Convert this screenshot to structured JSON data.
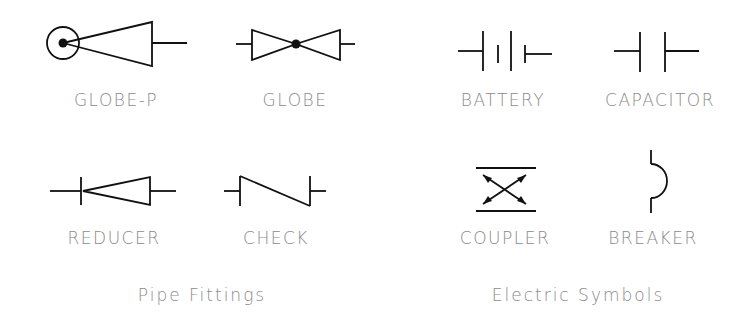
{
  "groups": {
    "pipe_fittings": {
      "title": "Pipe Fittings",
      "symbols": [
        {
          "name": "globe-p",
          "label": "GLOBE-P"
        },
        {
          "name": "globe",
          "label": "GLOBE"
        },
        {
          "name": "reducer",
          "label": "REDUCER"
        },
        {
          "name": "check",
          "label": "CHECK"
        }
      ]
    },
    "electric_symbols": {
      "title": "Electric Symbols",
      "symbols": [
        {
          "name": "battery",
          "label": "BATTERY"
        },
        {
          "name": "capacitor",
          "label": "CAPACITOR"
        },
        {
          "name": "coupler",
          "label": "COUPLER"
        },
        {
          "name": "breaker",
          "label": "BREAKER"
        }
      ]
    }
  },
  "colors": {
    "stroke": "#111111",
    "label": "#8a8a8a",
    "background": "#ffffff"
  }
}
